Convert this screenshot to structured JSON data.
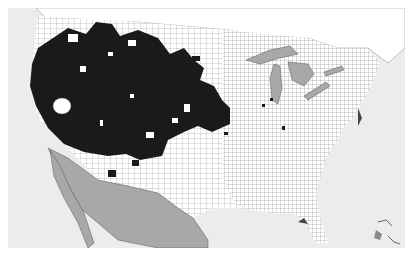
{
  "map": {
    "type": "choropleth",
    "subject": "US county map with highlighted counties",
    "region": "Contiguous United States with portions of Canada and Mexico",
    "colors": {
      "ocean": "#ececec",
      "us_land": "#ffffff",
      "county_lines": "#555555",
      "highlighted_counties": "#1a1a1a",
      "mexico_and_lakes": "#a8a8a8",
      "canada": "#ffffff"
    },
    "legend": [],
    "highlighted_region": "Western US (Pacific coast through Great Plains)",
    "scattered_highlights": "A few isolated counties in the Midwest and East"
  }
}
